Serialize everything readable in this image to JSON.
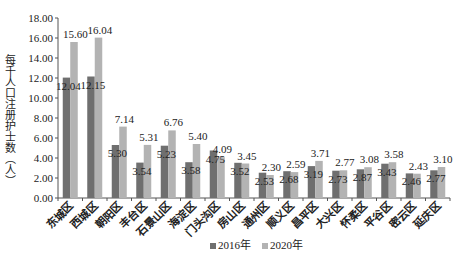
{
  "chart_data": {
    "type": "bar",
    "title": "",
    "xlabel": "",
    "ylabel": "每千人口注册护士数（人）",
    "ylim": [
      0,
      18
    ],
    "yticks": [
      "0.00",
      "2.00",
      "4.00",
      "6.00",
      "8.00",
      "10.00",
      "12.00",
      "14.00",
      "16.00",
      "18.00"
    ],
    "grid": false,
    "legend_position": "bottom",
    "categories": [
      "东城区",
      "西城区",
      "朝阳区",
      "丰台区",
      "石景山区",
      "海淀区",
      "门头沟区",
      "房山区",
      "通州区",
      "顺义区",
      "昌平区",
      "大兴区",
      "怀柔区",
      "平谷区",
      "密云区",
      "延庆区"
    ],
    "series": [
      {
        "name": "2016年",
        "color": "#6f6f6f",
        "values": [
          12.04,
          12.15,
          5.3,
          3.54,
          5.23,
          3.58,
          4.75,
          3.52,
          2.53,
          2.68,
          3.19,
          2.73,
          2.87,
          3.43,
          2.46,
          2.77
        ]
      },
      {
        "name": "2020年",
        "color": "#b3b3b3",
        "values": [
          15.6,
          16.04,
          7.14,
          5.31,
          6.76,
          5.4,
          4.09,
          3.45,
          2.3,
          2.59,
          3.71,
          2.77,
          3.08,
          3.58,
          2.43,
          3.1
        ]
      }
    ]
  },
  "legend": {
    "items": [
      {
        "label": "2016年",
        "color": "#6f6f6f"
      },
      {
        "label": "2020年",
        "color": "#b3b3b3"
      }
    ]
  }
}
